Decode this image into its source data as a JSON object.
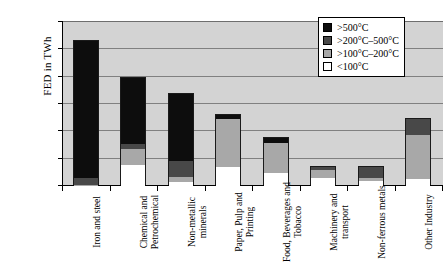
{
  "chart_data": {
    "type": "bar",
    "title": "",
    "subtitle": "",
    "xlabel": "",
    "ylabel": "FED in TWh",
    "ylim": [
      0,
      600
    ],
    "yticks": [
      0,
      100,
      200,
      300,
      400,
      500,
      600
    ],
    "ytick_labels": [
      "0",
      "100",
      "200",
      "300",
      "400",
      "500",
      "600"
    ],
    "grid": true,
    "grid_axis": "y",
    "stacked": true,
    "legend_position": "top-right",
    "plot_background": "#d3d3d3",
    "categories": [
      "Iron and steel",
      "Chemical and Petrochemical",
      "Non-metallic minerals",
      "Paper, Pulp and Printing",
      "Food, Beverages and Tobacco",
      "Machinery and transport",
      "Non-ferrous metals",
      "Other Industry"
    ],
    "series": [
      {
        "name": ">500°C",
        "color": "#0d0d0d",
        "values": [
          500,
          240,
          247,
          15,
          18,
          0,
          0,
          0
        ]
      },
      {
        "name": ">200°C–500°C",
        "color": "#484848",
        "values": [
          25,
          20,
          57,
          0,
          0,
          10,
          40,
          60
        ]
      },
      {
        "name": ">100°C–200°C",
        "color": "#a8a8a8",
        "values": [
          5,
          60,
          18,
          175,
          110,
          32,
          8,
          160
        ]
      },
      {
        "name": "<100°C",
        "color": "#ffffff",
        "values": [
          0,
          75,
          15,
          70,
          47,
          28,
          20,
          25
        ]
      }
    ],
    "totals": [
      530,
      395,
      337,
      260,
      175,
      70,
      68,
      245
    ]
  },
  "legend": {
    "entries": [
      {
        "label": ">500°C"
      },
      {
        "label": ">200°C–500°C"
      },
      {
        "label": ">100°C–200°C"
      },
      {
        "label": "<100°C"
      }
    ]
  }
}
